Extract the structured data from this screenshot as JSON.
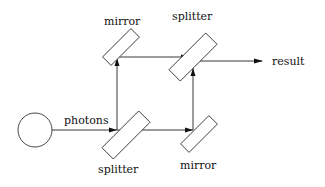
{
  "diagram": {
    "type": "Mach-Zehnder interferometer",
    "labels": {
      "source": "photons",
      "splitter_in": "splitter",
      "splitter_out": "splitter",
      "mirror_top": "mirror",
      "mirror_bottom": "mirror",
      "output": "result"
    },
    "nodes": [
      {
        "id": "source",
        "shape": "circle",
        "label": ""
      },
      {
        "id": "splitter_in",
        "shape": "tilted-rectangle",
        "label": "splitter"
      },
      {
        "id": "mirror_top",
        "shape": "tilted-rectangle",
        "label": "mirror"
      },
      {
        "id": "mirror_bottom",
        "shape": "tilted-rectangle",
        "label": "mirror"
      },
      {
        "id": "splitter_out",
        "shape": "tilted-rectangle",
        "label": "splitter"
      }
    ],
    "edges": [
      {
        "from": "source",
        "to": "splitter_in",
        "label": "photons"
      },
      {
        "from": "splitter_in",
        "to": "mirror_top"
      },
      {
        "from": "splitter_in",
        "to": "mirror_bottom"
      },
      {
        "from": "mirror_top",
        "to": "splitter_out"
      },
      {
        "from": "mirror_bottom",
        "to": "splitter_out"
      },
      {
        "from": "splitter_out",
        "to": "output",
        "label": "result"
      }
    ],
    "colors": {
      "stroke": "#333333",
      "background": "#ffffff"
    }
  }
}
